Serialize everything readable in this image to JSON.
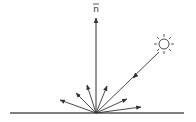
{
  "diagram": {
    "type": "diffuse-reflection",
    "normal_label": "n",
    "normal_label_overbar": true,
    "colors": {
      "stroke": "#333333",
      "surface": "#555555",
      "background": "#ffffff"
    },
    "surface": {
      "x1": 10,
      "y1": 113,
      "x2": 184,
      "y2": 113
    },
    "origin": {
      "x": 96,
      "y": 113
    },
    "normal": {
      "x": 96,
      "y_tip": 18
    },
    "light_source": {
      "cx": 164,
      "cy": 44,
      "r": 5,
      "ray_count": 8
    },
    "incident_ray": {
      "x1": 159,
      "y1": 52,
      "x2": 96,
      "y2": 113,
      "arrow_at": {
        "x": 133,
        "y": 78
      }
    },
    "reflected_rays": [
      {
        "x": 60,
        "y": 100
      },
      {
        "x": 76,
        "y": 93
      },
      {
        "x": 87,
        "y": 85
      },
      {
        "x": 107,
        "y": 86
      },
      {
        "x": 127,
        "y": 99
      },
      {
        "x": 141,
        "y": 107
      }
    ]
  }
}
